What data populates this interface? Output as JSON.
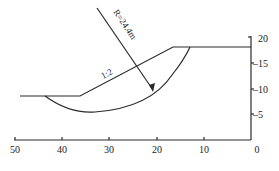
{
  "diagram": {
    "type": "slope-stability-section",
    "radius_label": "R=24.4m",
    "slope_label": "1:2",
    "x_axis": {
      "ticks": [
        "50",
        "40",
        "30",
        "20",
        "10",
        "0"
      ]
    },
    "y_axis": {
      "ticks": [
        "20",
        "–15",
        "–10",
        "–5"
      ]
    }
  }
}
